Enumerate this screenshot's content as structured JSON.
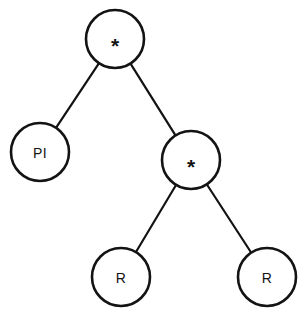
{
  "diagram": {
    "background_color": "#ffffff",
    "stroke_color": "#131313",
    "node_fill_color": "#ffffff",
    "node_radius": 29,
    "nodes": [
      {
        "id": "root",
        "label": "*",
        "kind": "operator",
        "x": 115,
        "y": 39,
        "r": 29
      },
      {
        "id": "left-leaf",
        "label": "PI",
        "kind": "value",
        "x": 40,
        "y": 152,
        "r": 29
      },
      {
        "id": "right-inner",
        "label": "*",
        "kind": "operator",
        "x": 191,
        "y": 160,
        "r": 29
      },
      {
        "id": "leaf-r1",
        "label": "R",
        "kind": "value",
        "x": 121,
        "y": 277,
        "r": 29
      },
      {
        "id": "leaf-r2",
        "label": "R",
        "kind": "value",
        "x": 267,
        "y": 277,
        "r": 29
      }
    ],
    "edges": [
      {
        "id": "edge-root-left",
        "from": "root",
        "to": "left-leaf"
      },
      {
        "id": "edge-root-right",
        "from": "root",
        "to": "right-inner"
      },
      {
        "id": "edge-inner-left",
        "from": "right-inner",
        "to": "leaf-r1"
      },
      {
        "id": "edge-inner-right",
        "from": "right-inner",
        "to": "leaf-r2"
      }
    ]
  }
}
